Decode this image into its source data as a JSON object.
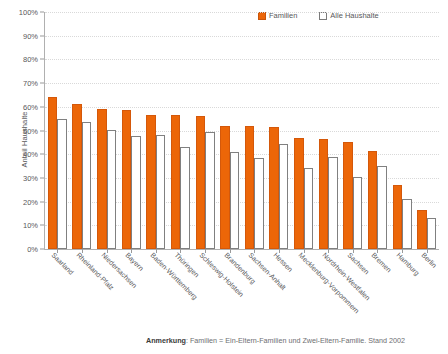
{
  "legend": {
    "entries": [
      {
        "label": "Familien",
        "color": "#ec6608",
        "style": "filled"
      },
      {
        "label": "Alle Haushalte",
        "color": "#ffffff",
        "style": "outlined"
      }
    ]
  },
  "axes": {
    "y_title": "Anteil Haushalte",
    "y_ticks": [
      "100%",
      "90%",
      "80%",
      "70%",
      "60%",
      "50%",
      "40%",
      "30%",
      "20%",
      "10%",
      "0%"
    ]
  },
  "footnote": {
    "bold_prefix": "Anmerkung",
    "text": ": Familien = Ein-Eltern-Familien und Zwei-Eltern-Familie. Stand 2002"
  },
  "chart_data": {
    "type": "bar",
    "title": "",
    "xlabel": "",
    "ylabel": "Anteil Haushalte",
    "ylim": [
      0,
      100
    ],
    "ytick_step": 10,
    "grid": true,
    "legend_position": "top-right",
    "value_unit": "percent",
    "categories": [
      "Saarland",
      "Rheinland-Pfalz",
      "Niedersachsen",
      "Bayern",
      "Baden-Württemberg",
      "Thüringen",
      "Schleswig-Holstein",
      "Brandenburg",
      "Sachsen-Anhalt",
      "Hessen",
      "Mecklenburg-Vorpommern",
      "Nordrhein-Westfalen",
      "Sachsen",
      "Bremen",
      "Hamburg",
      "Berlin"
    ],
    "series": [
      {
        "name": "Familien",
        "color": "#ec6608",
        "values": [
          64,
          61,
          59,
          58.5,
          56.5,
          56.5,
          56,
          52,
          52,
          51.5,
          47,
          46.5,
          45,
          41.5,
          27,
          16.5
        ]
      },
      {
        "name": "Alle Haushalte",
        "color": "#ffffff",
        "values": [
          55,
          53.8,
          50.3,
          47.5,
          48.3,
          43,
          49.5,
          41,
          38.5,
          44.5,
          34,
          39,
          30.5,
          35,
          21,
          13
        ]
      }
    ],
    "annotation": "Anmerkung: Familien = Ein-Eltern-Familien und Zwei-Eltern-Familie. Stand 2002"
  }
}
